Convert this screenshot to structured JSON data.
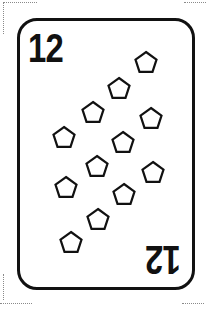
{
  "card": {
    "rank": "12",
    "suit_icon": "pentagon-icon",
    "pip_count": 12,
    "colors": {
      "ink": "#111111",
      "background": "#ffffff",
      "cut_marks": "#8a8a8a"
    },
    "pips": [
      {
        "x": 146,
        "y": 62
      },
      {
        "x": 119,
        "y": 88
      },
      {
        "x": 93,
        "y": 112
      },
      {
        "x": 151,
        "y": 118
      },
      {
        "x": 64,
        "y": 137
      },
      {
        "x": 123,
        "y": 142
      },
      {
        "x": 97,
        "y": 166
      },
      {
        "x": 153,
        "y": 172
      },
      {
        "x": 66,
        "y": 187
      },
      {
        "x": 124,
        "y": 194
      },
      {
        "x": 98,
        "y": 219
      },
      {
        "x": 71,
        "y": 242
      }
    ]
  }
}
